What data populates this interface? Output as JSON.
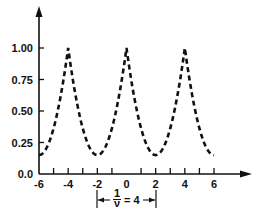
{
  "chart_data": {
    "type": "line",
    "title": "",
    "xlabel": "",
    "ylabel": "",
    "xlim": [
      -6,
      6
    ],
    "ylim": [
      0,
      1.0
    ],
    "grid": false,
    "legend": null,
    "x_ticks": [
      -6,
      -4,
      -2,
      0,
      2,
      4,
      6
    ],
    "x_tick_labels": [
      "-6",
      "-4",
      "-2",
      "0",
      "2",
      "4",
      "6"
    ],
    "x_minor_ticks": [
      -5,
      -3,
      -1,
      1,
      3,
      5
    ],
    "y_ticks": [
      0.0,
      0.25,
      0.5,
      0.75,
      1.0
    ],
    "y_tick_labels": [
      "0.0",
      "0.25",
      "0.50",
      "0.75",
      "1.00"
    ],
    "series": [
      {
        "name": "periodic response",
        "style": "dashed",
        "x": [
          -6,
          -5.5,
          -5,
          -4.5,
          -4,
          -3.5,
          -3,
          -2.5,
          -2,
          -1.5,
          -1,
          -0.5,
          0,
          0.5,
          1,
          1.5,
          2,
          2.5,
          3,
          3.5,
          4,
          4.5,
          5,
          5.5,
          6
        ],
        "y": [
          0.15,
          0.28,
          0.47,
          0.72,
          1.0,
          0.72,
          0.47,
          0.22,
          0.15,
          0.22,
          0.47,
          0.72,
          1.0,
          0.72,
          0.47,
          0.22,
          0.15,
          0.22,
          0.47,
          0.72,
          1.0,
          0.72,
          0.47,
          0.22,
          0.15
        ]
      }
    ],
    "annotations": [
      {
        "text": "1/ν = 4",
        "type": "period-bracket",
        "from_x": -2,
        "to_x": 2
      }
    ]
  },
  "annotation": {
    "numerator": "1",
    "denominator": "ν",
    "equals": "= 4"
  }
}
